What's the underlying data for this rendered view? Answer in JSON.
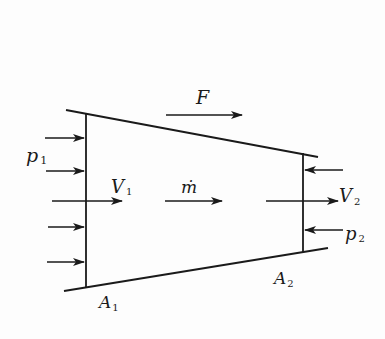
{
  "diagram": {
    "type": "control-volume nozzle/duct schematic",
    "labels": {
      "force": "F",
      "mass_flow": "ṁ",
      "inlet_pressure": {
        "main": "p",
        "sub": "1"
      },
      "inlet_velocity": {
        "main": "V",
        "sub": "1"
      },
      "inlet_area": {
        "main": "A",
        "sub": "1"
      },
      "outlet_pressure": {
        "main": "p",
        "sub": "2"
      },
      "outlet_velocity": {
        "main": "V",
        "sub": "2"
      },
      "outlet_area": {
        "main": "A",
        "sub": "2"
      }
    },
    "elements": [
      "top wall (converging)",
      "bottom wall (converging)",
      "inlet section line",
      "outlet section line",
      "5 inlet pressure arrows pointing right",
      "2 outlet pressure arrows pointing left",
      "force arrow F pointing right",
      "mass flow arrow pointing right",
      "inlet velocity arrow V1",
      "outlet velocity arrow V2"
    ],
    "colors": {
      "ink": "#1a1a1a",
      "background": "#fdfdfd"
    }
  }
}
